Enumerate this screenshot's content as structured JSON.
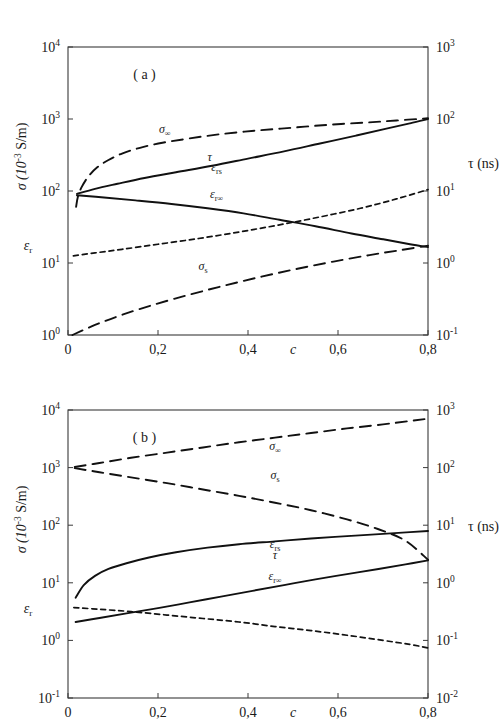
{
  "figure": {
    "panels": [
      {
        "tag": "( a )",
        "xlabel": "c",
        "xticks": [
          "0",
          "0,2",
          "0,4",
          "0,6",
          "0,8"
        ],
        "xlim": [
          0,
          0.8
        ],
        "left_axis": {
          "title_sigma": "σ (10",
          "title_sigma_exp": "-3",
          "title_sigma_unit": " S/m)",
          "title_eps": "ε",
          "title_eps_sub": "r",
          "ticks": [
            "0",
            "1",
            "2",
            "3",
            "4"
          ],
          "base": "10",
          "ylim": [
            0,
            4
          ]
        },
        "right_axis": {
          "title": "τ (ns)",
          "ticks": [
            "-1",
            "0",
            "1",
            "2",
            "3"
          ],
          "base": "10",
          "ylim": [
            -1,
            3
          ]
        },
        "curves": [
          {
            "name": "sigma-infinity",
            "label_main": "σ",
            "label_sub": "∞",
            "style": "dashed-long",
            "label_x": 0.215,
            "label_y_dec": 2.8,
            "axis": "left",
            "points": [
              [
                0.018,
                1.78
              ],
              [
                0.022,
                1.92
              ],
              [
                0.03,
                2.05
              ],
              [
                0.045,
                2.2
              ],
              [
                0.065,
                2.33
              ],
              [
                0.09,
                2.43
              ],
              [
                0.12,
                2.52
              ],
              [
                0.16,
                2.6
              ],
              [
                0.21,
                2.67
              ],
              [
                0.27,
                2.73
              ],
              [
                0.34,
                2.79
              ],
              [
                0.42,
                2.84
              ],
              [
                0.5,
                2.88
              ],
              [
                0.58,
                2.92
              ],
              [
                0.66,
                2.95
              ],
              [
                0.73,
                2.98
              ],
              [
                0.8,
                3.01
              ]
            ]
          },
          {
            "name": "epsilon-rs",
            "label_main": "ε",
            "label_sub": "rs",
            "style": "solid",
            "label_x": 0.33,
            "label_y_dec": 2.28,
            "axis": "left",
            "points": [
              [
                0.02,
                1.96
              ],
              [
                0.06,
                2.03
              ],
              [
                0.11,
                2.1
              ],
              [
                0.17,
                2.18
              ],
              [
                0.24,
                2.26
              ],
              [
                0.32,
                2.35
              ],
              [
                0.4,
                2.45
              ],
              [
                0.48,
                2.55
              ],
              [
                0.56,
                2.66
              ],
              [
                0.64,
                2.77
              ],
              [
                0.71,
                2.87
              ],
              [
                0.76,
                2.94
              ],
              [
                0.8,
                3.0
              ]
            ]
          },
          {
            "name": "epsilon-r-infinity",
            "label_main": "ε",
            "label_sub": "r∞",
            "style": "solid",
            "label_x": 0.33,
            "label_y_dec": 1.9,
            "axis": "left",
            "points": [
              [
                0.02,
                1.94
              ],
              [
                0.08,
                1.91
              ],
              [
                0.15,
                1.87
              ],
              [
                0.23,
                1.82
              ],
              [
                0.31,
                1.76
              ],
              [
                0.39,
                1.69
              ],
              [
                0.47,
                1.6
              ],
              [
                0.55,
                1.51
              ],
              [
                0.63,
                1.41
              ],
              [
                0.7,
                1.33
              ],
              [
                0.76,
                1.26
              ],
              [
                0.8,
                1.22
              ]
            ]
          },
          {
            "name": "tau",
            "label_main": "τ",
            "label_sub": "",
            "style": "dashed-short",
            "label_x": 0.315,
            "label_y_dec": 1.42,
            "axis": "right",
            "points": [
              [
                0.012,
                0.1
              ],
              [
                0.06,
                0.14
              ],
              [
                0.12,
                0.19
              ],
              [
                0.2,
                0.26
              ],
              [
                0.29,
                0.34
              ],
              [
                0.38,
                0.43
              ],
              [
                0.47,
                0.53
              ],
              [
                0.56,
                0.64
              ],
              [
                0.65,
                0.76
              ],
              [
                0.73,
                0.89
              ],
              [
                0.8,
                1.02
              ]
            ]
          },
          {
            "name": "sigma-s",
            "label_main": "σ",
            "label_sub": "s",
            "style": "dashed-long",
            "label_x": 0.3,
            "label_y_dec": 0.9,
            "axis": "left",
            "points": [
              [
                0.01,
                0.0
              ],
              [
                0.06,
                0.14
              ],
              [
                0.12,
                0.28
              ],
              [
                0.19,
                0.42
              ],
              [
                0.27,
                0.56
              ],
              [
                0.35,
                0.69
              ],
              [
                0.43,
                0.81
              ],
              [
                0.51,
                0.92
              ],
              [
                0.59,
                1.02
              ],
              [
                0.67,
                1.11
              ],
              [
                0.74,
                1.18
              ],
              [
                0.8,
                1.24
              ]
            ]
          }
        ]
      },
      {
        "tag": "( b )",
        "xlabel": "c",
        "xticks": [
          "0",
          "0,2",
          "0,4",
          "0,6",
          "0,8"
        ],
        "xlim": [
          0,
          0.8
        ],
        "left_axis": {
          "title_sigma": "σ (10",
          "title_sigma_exp": "-3",
          "title_sigma_unit": " S/m)",
          "title_eps": "ε",
          "title_eps_sub": "r",
          "ticks": [
            "-1",
            "0",
            "1",
            "2",
            "3",
            "4"
          ],
          "base": "10",
          "ylim": [
            -1,
            4
          ]
        },
        "right_axis": {
          "title": "τ (ns)",
          "ticks": [
            "-2",
            "-1",
            "0",
            "1",
            "2",
            "3"
          ],
          "base": "10",
          "ylim": [
            -2,
            3
          ]
        },
        "curves": [
          {
            "name": "sigma-infinity",
            "label_main": "σ",
            "label_sub": "∞",
            "style": "dashed-long",
            "label_x": 0.46,
            "label_y_dec": 3.3,
            "axis": "left",
            "points": [
              [
                0.015,
                3.01
              ],
              [
                0.07,
                3.08
              ],
              [
                0.14,
                3.17
              ],
              [
                0.22,
                3.26
              ],
              [
                0.3,
                3.35
              ],
              [
                0.38,
                3.44
              ],
              [
                0.46,
                3.52
              ],
              [
                0.54,
                3.6
              ],
              [
                0.62,
                3.68
              ],
              [
                0.7,
                3.75
              ],
              [
                0.76,
                3.81
              ],
              [
                0.8,
                3.85
              ]
            ]
          },
          {
            "name": "sigma-s",
            "label_main": "σ",
            "label_sub": "s",
            "style": "dashed-long",
            "label_x": 0.46,
            "label_y_dec": 2.8,
            "axis": "left",
            "points": [
              [
                0.015,
                2.99
              ],
              [
                0.07,
                2.92
              ],
              [
                0.14,
                2.83
              ],
              [
                0.22,
                2.73
              ],
              [
                0.3,
                2.62
              ],
              [
                0.38,
                2.51
              ],
              [
                0.46,
                2.39
              ],
              [
                0.54,
                2.26
              ],
              [
                0.62,
                2.1
              ],
              [
                0.69,
                1.93
              ],
              [
                0.75,
                1.73
              ],
              [
                0.8,
                1.4
              ]
            ]
          },
          {
            "name": "epsilon-rs",
            "label_main": "ε",
            "label_sub": "rs",
            "style": "solid",
            "label_x": 0.46,
            "label_y_dec": 1.6,
            "axis": "left",
            "points": [
              [
                0.017,
                0.74
              ],
              [
                0.035,
                0.96
              ],
              [
                0.06,
                1.12
              ],
              [
                0.09,
                1.24
              ],
              [
                0.13,
                1.34
              ],
              [
                0.18,
                1.44
              ],
              [
                0.24,
                1.53
              ],
              [
                0.31,
                1.61
              ],
              [
                0.38,
                1.67
              ],
              [
                0.46,
                1.72
              ],
              [
                0.54,
                1.77
              ],
              [
                0.62,
                1.81
              ],
              [
                0.7,
                1.85
              ],
              [
                0.76,
                1.88
              ],
              [
                0.8,
                1.9
              ]
            ]
          },
          {
            "name": "epsilon-r-infinity",
            "label_main": "ε",
            "label_sub": "r∞",
            "style": "solid",
            "label_x": 0.46,
            "label_y_dec": 1.04,
            "axis": "left",
            "points": [
              [
                0.017,
                0.32
              ],
              [
                0.07,
                0.39
              ],
              [
                0.13,
                0.47
              ],
              [
                0.2,
                0.56
              ],
              [
                0.27,
                0.66
              ],
              [
                0.34,
                0.76
              ],
              [
                0.41,
                0.86
              ],
              [
                0.48,
                0.96
              ],
              [
                0.55,
                1.06
              ],
              [
                0.62,
                1.15
              ],
              [
                0.69,
                1.24
              ],
              [
                0.75,
                1.32
              ],
              [
                0.8,
                1.39
              ]
            ]
          },
          {
            "name": "tau",
            "label_main": "τ",
            "label_sub": "",
            "style": "dashed-short",
            "label_x": 0.46,
            "label_y_dec": 0.42,
            "axis": "right",
            "points": [
              [
                0.013,
                -0.43
              ],
              [
                0.07,
                -0.46
              ],
              [
                0.14,
                -0.5
              ],
              [
                0.22,
                -0.56
              ],
              [
                0.3,
                -0.62
              ],
              [
                0.38,
                -0.68
              ],
              [
                0.46,
                -0.76
              ],
              [
                0.54,
                -0.83
              ],
              [
                0.62,
                -0.91
              ],
              [
                0.7,
                -1.0
              ],
              [
                0.76,
                -1.07
              ],
              [
                0.8,
                -1.13
              ]
            ]
          }
        ]
      }
    ]
  }
}
